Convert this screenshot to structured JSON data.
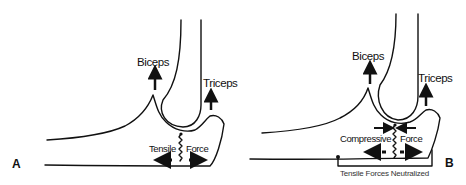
{
  "figure": {
    "panels": [
      {
        "id": "A",
        "label": "A",
        "muscles": {
          "biceps": "Biceps",
          "triceps": "Triceps"
        },
        "force_labels": {
          "left": "Tensile",
          "right": "Force"
        }
      },
      {
        "id": "B",
        "label": "B",
        "muscles": {
          "biceps": "Biceps",
          "triceps": "Triceps"
        },
        "force_labels": {
          "left": "Compressive",
          "right": "Force"
        },
        "caption": "Tensile Forces Neutralized"
      }
    ]
  }
}
